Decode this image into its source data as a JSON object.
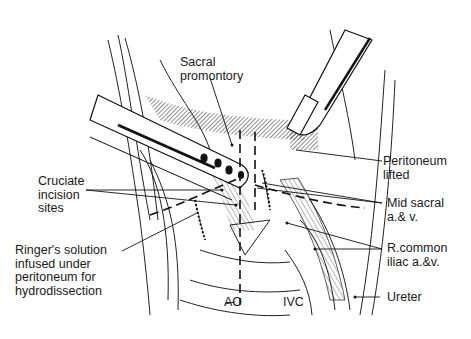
{
  "figure": {
    "labels": {
      "sacral_promontory": "Sacral\npromontory",
      "peritoneum_lifted": "Peritoneum\nlifted",
      "cruciate_incision_sites": "Cruciate\nincision\nsites",
      "mid_sacral": "Mid sacral\na.& v.",
      "ringers_solution": "Ringer's solution\ninfused under\nperitoneum for\nhydrodissection",
      "r_common_iliac": "R.common\niliac a.&v.",
      "ao": "AO",
      "ivc": "IVC",
      "ureter": "Ureter"
    }
  }
}
